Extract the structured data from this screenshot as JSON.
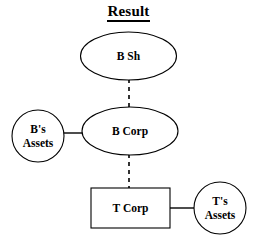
{
  "diagram": {
    "title": "Result",
    "title_underlined": true,
    "background_color": "#ffffff",
    "line_color": "#000000",
    "nodes": [
      {
        "id": "b-sh",
        "label": "B Sh",
        "shape": "ellipse",
        "cx": 128.5,
        "cy": 56,
        "rx": 48,
        "ry": 24
      },
      {
        "id": "b-corp",
        "label": "B Corp",
        "shape": "ellipse",
        "cx": 130,
        "cy": 131,
        "rx": 48,
        "ry": 24
      },
      {
        "id": "b-assets",
        "label_line1": "B's",
        "label_line2": "Assets",
        "shape": "circle",
        "cx": 38,
        "cy": 136,
        "r": 26
      },
      {
        "id": "t-corp",
        "label": "T Corp",
        "shape": "rect",
        "x": 91,
        "y": 188,
        "width": 79,
        "height": 40
      },
      {
        "id": "t-assets",
        "label_line1": "T's",
        "label_line2": "Assets",
        "shape": "circle",
        "cx": 220,
        "cy": 208,
        "r": 26
      }
    ],
    "edges": [
      {
        "id": "edge-bsh-bcorp",
        "from": "b-sh",
        "to": "b-corp",
        "style": "dashed",
        "orientation": "vertical",
        "x1": 129,
        "y1": 80,
        "x2": 129,
        "y2": 107
      },
      {
        "id": "edge-bassets-bcorp",
        "from": "b-assets",
        "to": "b-corp",
        "style": "solid",
        "orientation": "horizontal",
        "x1": 64,
        "y1": 133,
        "x2": 84,
        "y2": 133
      },
      {
        "id": "edge-bcorp-tcorp",
        "from": "b-corp",
        "to": "t-corp",
        "style": "dashed",
        "orientation": "vertical",
        "x1": 129,
        "y1": 155,
        "x2": 129,
        "y2": 188
      },
      {
        "id": "edge-tcorp-tassets",
        "from": "t-corp",
        "to": "t-assets",
        "style": "solid",
        "orientation": "horizontal",
        "x1": 170,
        "y1": 208,
        "x2": 194,
        "y2": 208
      }
    ]
  }
}
